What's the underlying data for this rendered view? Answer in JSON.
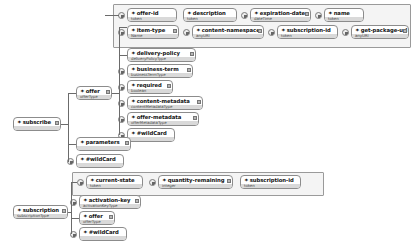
{
  "diagram": {
    "kind": "xml-schema-tree",
    "background": "#ffffff",
    "node_border_color": "#8c8c8c",
    "node_type_band_color": "#d9d9d9",
    "group_box_color": "#f4f4f4",
    "connector_color": "#6b6b6b"
  },
  "roots": {
    "subscribe": {
      "label": "subscribe",
      "type": ""
    },
    "subscription": {
      "label": "subscription",
      "type": "subscriptionType"
    }
  },
  "subscribe_children": {
    "offer": {
      "label": "offer",
      "type": "offerType"
    },
    "parameters": {
      "label": "parameters",
      "type": ""
    },
    "wildcard": {
      "label": "#wildCard",
      "type": ""
    }
  },
  "offer_children": [
    {
      "label": "delivery-policy",
      "type": "deliveryPolicyType"
    },
    {
      "label": "business-term",
      "type": "businessTermType"
    },
    {
      "label": "required",
      "type": "boolean"
    },
    {
      "label": "content-metadata",
      "type": "contentMetadataType"
    },
    {
      "label": "offer-metadata",
      "type": "offerMetadataType"
    },
    {
      "label": "#wildCard",
      "type": ""
    }
  ],
  "offer_attributes": [
    {
      "label": "offer-id",
      "type": "token"
    },
    {
      "label": "description",
      "type": "token"
    },
    {
      "label": "expiration-date",
      "type": "dateTime"
    },
    {
      "label": "name",
      "type": "token"
    },
    {
      "label": "item-type",
      "type": "Name"
    },
    {
      "label": "content-namespace",
      "type": "anyURI"
    },
    {
      "label": "subscription-id",
      "type": "token"
    },
    {
      "label": "get-package-url",
      "type": "anyURI"
    }
  ],
  "subscription_children": {
    "activation_key": {
      "label": "activation-key",
      "type": "activationKeyType"
    },
    "offer": {
      "label": "offer",
      "type": "offerType"
    },
    "wildcard": {
      "label": "#wildCard",
      "type": ""
    }
  },
  "subscription_attributes": [
    {
      "label": "current-state",
      "type": "token"
    },
    {
      "label": "quantity-remaining",
      "type": "integer"
    },
    {
      "label": "subscription-id",
      "type": "token"
    }
  ],
  "glyphs": {
    "element_plus": "✦",
    "occurrence_indicator": "occurrence-icon",
    "expander": "expander-icon"
  }
}
